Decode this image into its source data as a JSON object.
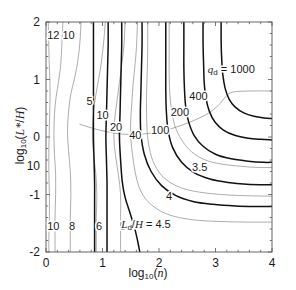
{
  "figure": {
    "background": "#ffffff",
    "plot_area": {
      "left": 46,
      "top": 22,
      "right": 272,
      "bottom": 252
    },
    "frame_color": "#555555"
  },
  "chart_data": {
    "type": "line",
    "title": "",
    "subtitle": "",
    "xlabel": "log10(n)",
    "ylabel": "log10(L*/H)",
    "xlim": [
      0,
      4
    ],
    "ylim": [
      -2,
      2
    ],
    "xticks": [
      0,
      1,
      2,
      3,
      4
    ],
    "xticklabels": [
      "0",
      "1",
      "2",
      "3",
      "4"
    ],
    "yticks": [
      2,
      1,
      0,
      -1,
      -2
    ],
    "yticklabels": [
      "2",
      "1",
      "0",
      "-1",
      "-2"
    ],
    "stray_y_label": {
      "text": "10",
      "value": -0.5
    },
    "grid": false,
    "legend": "none",
    "series": [
      {
        "name": "Ld/H = 12",
        "family": "Ld_over_H",
        "value": 12,
        "style": "thin-gray",
        "color": "#8a8a8a",
        "width": 0.7,
        "points": [
          [
            0.04,
            2.0
          ],
          [
            0.05,
            1.55
          ],
          [
            0.06,
            1.2
          ],
          [
            0.07,
            0.95
          ],
          [
            0.07,
            0.6
          ],
          [
            0.06,
            0.2
          ],
          [
            0.05,
            -0.2
          ],
          [
            0.05,
            -0.6
          ],
          [
            0.06,
            -1.0
          ],
          [
            0.06,
            -1.4
          ],
          [
            0.05,
            -1.75
          ],
          [
            0.05,
            -2.0
          ]
        ]
      },
      {
        "name": "Ld/H = 10",
        "family": "Ld_over_H",
        "value": 10,
        "style": "thin-gray",
        "color": "#8a8a8a",
        "width": 0.7,
        "points": [
          [
            0.3,
            2.0
          ],
          [
            0.28,
            1.6
          ],
          [
            0.26,
            1.25
          ],
          [
            0.22,
            0.95
          ],
          [
            0.18,
            0.7
          ],
          [
            0.15,
            0.4
          ],
          [
            0.14,
            0.05
          ],
          [
            0.15,
            -0.3
          ],
          [
            0.17,
            -0.65
          ],
          [
            0.17,
            -1.0
          ],
          [
            0.16,
            -1.4
          ],
          [
            0.16,
            -1.75
          ],
          [
            0.16,
            -2.0
          ]
        ]
      },
      {
        "name": "Ld/H = 8",
        "family": "Ld_over_H",
        "value": 8,
        "style": "thin-gray",
        "color": "#8a8a8a",
        "width": 0.7,
        "points": [
          [
            0.62,
            2.0
          ],
          [
            0.6,
            1.65
          ],
          [
            0.56,
            1.3
          ],
          [
            0.5,
            1.0
          ],
          [
            0.44,
            0.75
          ],
          [
            0.4,
            0.45
          ],
          [
            0.38,
            0.1
          ],
          [
            0.4,
            -0.25
          ],
          [
            0.43,
            -0.6
          ],
          [
            0.44,
            -1.0
          ],
          [
            0.43,
            -1.4
          ],
          [
            0.43,
            -1.75
          ],
          [
            0.43,
            -2.0
          ]
        ]
      },
      {
        "name": "Ld/H = 6",
        "family": "Ld_over_H",
        "value": 6,
        "style": "thin-gray",
        "color": "#8a8a8a",
        "width": 0.7,
        "points": [
          [
            1.05,
            2.0
          ],
          [
            1.02,
            1.65
          ],
          [
            0.98,
            1.3
          ],
          [
            0.93,
            1.0
          ],
          [
            0.88,
            0.72
          ],
          [
            0.84,
            0.42
          ],
          [
            0.82,
            0.08
          ],
          [
            0.84,
            -0.28
          ],
          [
            0.88,
            -0.62
          ],
          [
            0.9,
            -1.0
          ],
          [
            0.89,
            -1.4
          ],
          [
            0.89,
            -1.75
          ],
          [
            0.89,
            -2.0
          ]
        ]
      },
      {
        "name": "Ld/H = 5",
        "family": "Ld_over_H",
        "value": 5,
        "style": "thin-gray",
        "color": "#8a8a8a",
        "width": 0.7,
        "points": [
          [
            1.4,
            2.0
          ],
          [
            1.38,
            1.6
          ],
          [
            1.34,
            1.25
          ],
          [
            1.3,
            0.95
          ],
          [
            1.26,
            0.65
          ],
          [
            1.22,
            0.35
          ],
          [
            1.2,
            0.0
          ],
          [
            1.23,
            -0.32
          ],
          [
            1.28,
            -0.65
          ],
          [
            1.32,
            -1.0
          ],
          [
            1.32,
            -1.4
          ],
          [
            1.32,
            -1.75
          ],
          [
            1.32,
            -2.0
          ]
        ]
      },
      {
        "name": "Ld/H = 4.5",
        "family": "Ld_over_H",
        "value": 4.5,
        "style": "thin-gray",
        "color": "#8a8a8a",
        "width": 0.7,
        "points": [
          [
            1.62,
            2.0
          ],
          [
            1.6,
            1.55
          ],
          [
            1.57,
            1.2
          ],
          [
            1.54,
            0.9
          ],
          [
            1.52,
            0.6
          ],
          [
            1.5,
            0.3
          ],
          [
            1.5,
            0.0
          ],
          [
            1.53,
            -0.3
          ],
          [
            1.58,
            -0.62
          ],
          [
            1.66,
            -0.9
          ],
          [
            1.8,
            -1.12
          ],
          [
            2.05,
            -1.3
          ],
          [
            2.35,
            -1.4
          ],
          [
            2.7,
            -1.45
          ],
          [
            3.1,
            -1.47
          ],
          [
            3.55,
            -1.48
          ],
          [
            4.0,
            -1.48
          ]
        ]
      },
      {
        "name": "Ld/H = 4",
        "family": "Ld_over_H",
        "value": 4,
        "style": "thin-gray",
        "color": "#8a8a8a",
        "width": 0.7,
        "points": [
          [
            1.8,
            2.0
          ],
          [
            1.8,
            1.5
          ],
          [
            1.79,
            1.1
          ],
          [
            1.78,
            0.75
          ],
          [
            1.78,
            0.42
          ],
          [
            1.79,
            0.1
          ],
          [
            1.83,
            -0.2
          ],
          [
            1.92,
            -0.48
          ],
          [
            2.1,
            -0.72
          ],
          [
            2.38,
            -0.88
          ],
          [
            2.72,
            -0.96
          ],
          [
            3.1,
            -1.0
          ],
          [
            3.5,
            -1.02
          ],
          [
            4.0,
            -1.03
          ]
        ]
      },
      {
        "name": "Ld/H = 3.5",
        "family": "Ld_over_H",
        "value": 3.5,
        "style": "thin-gray",
        "color": "#8a8a8a",
        "width": 0.7,
        "points": [
          [
            2.18,
            2.0
          ],
          [
            2.18,
            1.5
          ],
          [
            2.18,
            1.1
          ],
          [
            2.19,
            0.78
          ],
          [
            2.22,
            0.48
          ],
          [
            2.28,
            0.2
          ],
          [
            2.4,
            -0.05
          ],
          [
            2.58,
            -0.26
          ],
          [
            2.82,
            -0.4
          ],
          [
            3.1,
            -0.47
          ],
          [
            3.45,
            -0.51
          ],
          [
            3.75,
            -0.53
          ],
          [
            4.0,
            -0.53
          ]
        ]
      },
      {
        "name": "Ld/H = 3 (upper sweep)",
        "family": "Ld_over_H",
        "value": 3,
        "style": "thin-gray",
        "color": "#8a8a8a",
        "width": 0.7,
        "points": [
          [
            0.6,
            0.22
          ],
          [
            0.95,
            0.12
          ],
          [
            1.35,
            0.05
          ],
          [
            1.8,
            0.06
          ],
          [
            2.2,
            0.14
          ],
          [
            2.55,
            0.26
          ],
          [
            2.85,
            0.4
          ],
          [
            3.05,
            0.55
          ],
          [
            3.18,
            0.7
          ],
          [
            3.3,
            0.78
          ],
          [
            3.6,
            0.8
          ],
          [
            4.0,
            0.8
          ]
        ]
      },
      {
        "name": "qd = 5",
        "family": "qd",
        "value": 5,
        "style": "thick-black",
        "color": "#111111",
        "width": 1.5,
        "points": [
          [
            0.84,
            2.0
          ],
          [
            0.84,
            1.6
          ],
          [
            0.84,
            1.2
          ],
          [
            0.84,
            0.8
          ],
          [
            0.84,
            0.4
          ],
          [
            0.84,
            0.0
          ],
          [
            0.85,
            -0.4
          ],
          [
            0.86,
            -0.8
          ],
          [
            0.86,
            -1.2
          ],
          [
            0.86,
            -1.6
          ],
          [
            0.86,
            -2.0
          ]
        ]
      },
      {
        "name": "qd = 10",
        "family": "qd",
        "value": 10,
        "style": "thick-black",
        "color": "#111111",
        "width": 1.5,
        "points": [
          [
            1.1,
            2.0
          ],
          [
            1.1,
            1.6
          ],
          [
            1.09,
            1.2
          ],
          [
            1.08,
            0.8
          ],
          [
            1.07,
            0.4
          ],
          [
            1.06,
            0.0
          ],
          [
            1.07,
            -0.4
          ],
          [
            1.08,
            -0.8
          ],
          [
            1.08,
            -1.2
          ],
          [
            1.08,
            -1.6
          ],
          [
            1.08,
            -2.0
          ]
        ]
      },
      {
        "name": "qd = 20",
        "family": "qd",
        "value": 20,
        "style": "thick-black",
        "color": "#111111",
        "width": 1.5,
        "points": [
          [
            1.34,
            2.0
          ],
          [
            1.34,
            1.6
          ],
          [
            1.33,
            1.2
          ],
          [
            1.32,
            0.8
          ],
          [
            1.31,
            0.4
          ],
          [
            1.3,
            0.0
          ],
          [
            1.32,
            -0.4
          ],
          [
            1.35,
            -0.78
          ],
          [
            1.4,
            -1.05
          ],
          [
            1.48,
            -1.3
          ],
          [
            1.56,
            -1.55
          ],
          [
            1.62,
            -1.8
          ],
          [
            1.66,
            -2.0
          ]
        ]
      },
      {
        "name": "qd = 40",
        "family": "qd",
        "value": 40,
        "style": "thick-black",
        "color": "#111111",
        "width": 1.5,
        "points": [
          [
            1.7,
            2.0
          ],
          [
            1.7,
            1.6
          ],
          [
            1.69,
            1.2
          ],
          [
            1.68,
            0.8
          ],
          [
            1.67,
            0.42
          ],
          [
            1.68,
            0.05
          ],
          [
            1.74,
            -0.3
          ],
          [
            1.86,
            -0.6
          ],
          [
            2.05,
            -0.85
          ],
          [
            2.3,
            -1.02
          ],
          [
            2.6,
            -1.12
          ],
          [
            2.95,
            -1.17
          ],
          [
            3.35,
            -1.2
          ],
          [
            3.7,
            -1.21
          ],
          [
            4.0,
            -1.21
          ]
        ]
      },
      {
        "name": "qd = 100",
        "family": "qd",
        "value": 100,
        "style": "thick-black",
        "color": "#111111",
        "width": 1.5,
        "points": [
          [
            2.12,
            2.0
          ],
          [
            2.12,
            1.6
          ],
          [
            2.12,
            1.2
          ],
          [
            2.12,
            0.8
          ],
          [
            2.13,
            0.45
          ],
          [
            2.16,
            0.12
          ],
          [
            2.24,
            -0.18
          ],
          [
            2.4,
            -0.44
          ],
          [
            2.62,
            -0.62
          ],
          [
            2.9,
            -0.73
          ],
          [
            3.22,
            -0.79
          ],
          [
            3.55,
            -0.82
          ],
          [
            4.0,
            -0.83
          ]
        ]
      },
      {
        "name": "qd = 200",
        "family": "qd",
        "value": 200,
        "style": "thick-black",
        "color": "#111111",
        "width": 1.5,
        "points": [
          [
            2.44,
            2.0
          ],
          [
            2.44,
            1.6
          ],
          [
            2.44,
            1.2
          ],
          [
            2.45,
            0.85
          ],
          [
            2.47,
            0.55
          ],
          [
            2.52,
            0.28
          ],
          [
            2.62,
            0.03
          ],
          [
            2.78,
            -0.16
          ],
          [
            3.0,
            -0.3
          ],
          [
            3.28,
            -0.38
          ],
          [
            3.58,
            -0.42
          ],
          [
            3.85,
            -0.44
          ],
          [
            4.0,
            -0.44
          ]
        ]
      },
      {
        "name": "qd = 400",
        "family": "qd",
        "value": 400,
        "style": "thick-black",
        "color": "#111111",
        "width": 1.5,
        "points": [
          [
            2.78,
            2.0
          ],
          [
            2.78,
            1.62
          ],
          [
            2.79,
            1.25
          ],
          [
            2.8,
            0.95
          ],
          [
            2.83,
            0.68
          ],
          [
            2.89,
            0.45
          ],
          [
            2.99,
            0.26
          ],
          [
            3.14,
            0.12
          ],
          [
            3.34,
            0.03
          ],
          [
            3.58,
            -0.02
          ],
          [
            3.8,
            -0.04
          ],
          [
            4.0,
            -0.05
          ]
        ]
      },
      {
        "name": "qd = 1000",
        "family": "qd",
        "value": 1000,
        "style": "thick-black",
        "color": "#111111",
        "width": 1.5,
        "points": [
          [
            3.1,
            2.0
          ],
          [
            3.1,
            1.65
          ],
          [
            3.11,
            1.35
          ],
          [
            3.13,
            1.08
          ],
          [
            3.17,
            0.85
          ],
          [
            3.24,
            0.66
          ],
          [
            3.35,
            0.52
          ],
          [
            3.5,
            0.42
          ],
          [
            3.68,
            0.36
          ],
          [
            3.86,
            0.33
          ],
          [
            4.0,
            0.32
          ]
        ]
      }
    ],
    "contour_labels": [
      {
        "text": "12",
        "x": 0.13,
        "y": 1.78,
        "family": "Ld_over_H",
        "style": "thin-gray"
      },
      {
        "text": "10",
        "x": 0.4,
        "y": 1.78,
        "family": "Ld_over_H",
        "style": "thin-gray"
      },
      {
        "text": "5",
        "x": 0.77,
        "y": 0.62,
        "family": "qd",
        "style": "thick-black"
      },
      {
        "text": "10",
        "x": 1.0,
        "y": 0.38,
        "family": "qd",
        "style": "thick-black"
      },
      {
        "text": "20",
        "x": 1.24,
        "y": 0.18,
        "family": "qd",
        "style": "thick-black"
      },
      {
        "text": "40",
        "x": 1.58,
        "y": 0.04,
        "family": "qd",
        "style": "thick-black"
      },
      {
        "text": "100",
        "x": 2.02,
        "y": 0.12,
        "family": "qd",
        "style": "thick-black"
      },
      {
        "text": "200",
        "x": 2.37,
        "y": 0.44,
        "family": "qd",
        "style": "thick-black"
      },
      {
        "text": "400",
        "x": 2.7,
        "y": 0.72,
        "family": "qd",
        "style": "thick-black"
      },
      {
        "text": "3.5",
        "x": 2.72,
        "y": -0.52,
        "family": "Ld_over_H",
        "style": "thin-gray"
      },
      {
        "text": "4",
        "x": 2.18,
        "y": -1.02,
        "family": "Ld_over_H",
        "style": "thin-gray"
      },
      {
        "text": "10",
        "x": 0.13,
        "y": -1.55,
        "family": "Ld_over_H",
        "style": "thin-gray"
      },
      {
        "text": "8",
        "x": 0.46,
        "y": -1.55,
        "family": "Ld_over_H",
        "style": "thin-gray"
      },
      {
        "text": "6",
        "x": 0.94,
        "y": -1.55,
        "family": "Ld_over_H",
        "style": "thin-gray"
      },
      {
        "text": "5",
        "x": 1.36,
        "y": -1.55,
        "family": "Ld_over_H",
        "style": "thin-gray"
      }
    ],
    "annotations": [
      {
        "name": "qd-series-label",
        "text": "q_d = 1000",
        "x": 3.28,
        "y": 1.18
      },
      {
        "name": "ldh-series-label",
        "text": "L_d/H = 4.5",
        "x": 1.77,
        "y": -1.52
      }
    ]
  }
}
